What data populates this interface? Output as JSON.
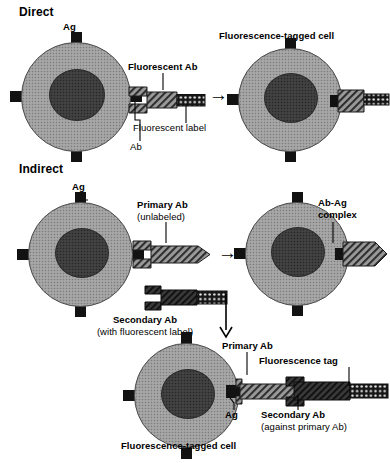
{
  "figure": {
    "title_direct": "Direct",
    "title_indirect": "Indirect"
  },
  "colors": {
    "membrane": "#9e9e9e",
    "nucleus": "#3c3c3c",
    "antigen": "#121212",
    "antibody_light": "#8a8a8a",
    "antibody_dark": "#3a3a3a",
    "label_tag": "#1a1a1a",
    "text": "#000000",
    "background": "#ffffff"
  },
  "direct": {
    "section_label": "Direct",
    "ag_label": "Ag",
    "fluorescent_ab_label": "Fluorescent Ab",
    "fluorescent_label_label": "Fluorescent label",
    "ab_label": "Ab",
    "result_label": "Fluorescence-tagged cell",
    "arrow": "→"
  },
  "indirect": {
    "section_label": "Indirect",
    "ag_label": "Ag",
    "primary_ab_label": "Primary Ab",
    "primary_ab_sub": "(unlabeled)",
    "ab_ag_complex_line1": "Ab-Ag",
    "ab_ag_complex_line2": "complex",
    "secondary_ab_label": "Secondary Ab",
    "secondary_ab_sub": "(with fluorescent label)",
    "arrow_right": "→",
    "arrow_down": "↓",
    "result": {
      "primary_ab_label": "Primary Ab",
      "fluorescence_tag_label": "Fluorescence tag",
      "ag_label": "Ag",
      "secondary_ab_label": "Secondary Ab",
      "secondary_ab_sub": "(against primary Ab)",
      "cell_label": "Fluorescence-tagged cell"
    }
  },
  "icons": {
    "cell": "cell-icon",
    "nucleus": "nucleus-icon",
    "antigen": "antigen-icon",
    "antibody": "antibody-icon",
    "fluorescent_tag": "fluorescent-tag-icon",
    "arrow_right": "arrow-right-icon",
    "arrow_down": "arrow-down-icon"
  }
}
